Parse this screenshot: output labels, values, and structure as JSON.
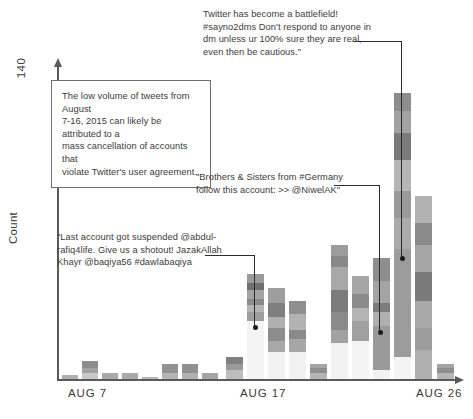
{
  "axes": {
    "y_label": "Count",
    "y_max_label": "140",
    "x_ticks": [
      {
        "label": "AUG 7",
        "x": 68
      },
      {
        "label": "AUG 17",
        "x": 240
      },
      {
        "label": "AUG 26",
        "x": 416
      }
    ]
  },
  "annotations": [
    {
      "id": "anno-top-right",
      "boxed": false,
      "lines": [
        "Twitter has become a battlefield!",
        "#sayno2dms Don't respond to anyone in",
        "dm unless ur 100% sure they are real,",
        "even then be cautious.\""
      ]
    },
    {
      "id": "anno-boxed-left",
      "boxed": true,
      "lines": [
        "The low volume of tweets from August",
        "7-16, 2015 can likely be attributed to a",
        "mass cancellation of accounts that",
        "violate Twitter's user agreement."
      ]
    },
    {
      "id": "anno-germany",
      "boxed": false,
      "lines": [
        "\"Brothers & Sisters from #Germany",
        "follow this account: >> @NiwelAK\""
      ]
    },
    {
      "id": "anno-suspended",
      "boxed": false,
      "lines": [
        "\"Last account got suspended @abdul-",
        "rafiq4life. Give us a shotout! JazakAllah",
        "Khayr @baqiya56 #dawlabaqiya"
      ]
    }
  ],
  "colors": {
    "axis": "#5a5a5a",
    "text": "#3b3b3b",
    "leader": "#2b2b2b",
    "segment_palette": [
      "#f4f4f4",
      "#d6d6d6",
      "#bdbdbd",
      "#a8a8a8",
      "#949494",
      "#7e7e7e",
      "#6a6a6a"
    ]
  },
  "chart_data": {
    "type": "bar",
    "title": "",
    "xlabel": "",
    "ylabel": "Count",
    "ylim": [
      0,
      140
    ],
    "grid": false,
    "legend": "none",
    "stacked": true,
    "categories": [
      "AUG 7",
      "AUG 8",
      "AUG 9",
      "AUG 10",
      "AUG 11",
      "AUG 12",
      "AUG 13",
      "AUG 14",
      "AUG 15",
      "AUG 16",
      "AUG 17",
      "AUG 18",
      "AUG 19",
      "AUG 20",
      "AUG 21",
      "AUG 22",
      "AUG 23",
      "AUG 24",
      "AUG 25",
      "AUG 26"
    ],
    "totals": [
      2,
      8,
      3,
      3,
      1,
      7,
      7,
      3,
      10,
      47,
      41,
      35,
      7,
      60,
      46,
      54,
      128,
      82,
      0,
      7
    ],
    "bars": [
      {
        "category": "AUG 7",
        "total": 2,
        "x": 62,
        "width": 16,
        "segments": [
          {
            "value": 2,
            "color": "#b0b0b0"
          }
        ]
      },
      {
        "category": "AUG 8",
        "total": 8,
        "x": 82,
        "width": 16,
        "segments": [
          {
            "value": 3,
            "color": "#c9c9c9"
          },
          {
            "value": 2,
            "color": "#a0a0a0"
          },
          {
            "value": 3,
            "color": "#8d8d8d"
          }
        ]
      },
      {
        "category": "AUG 9",
        "total": 3,
        "x": 102,
        "width": 16,
        "segments": [
          {
            "value": 3,
            "color": "#a8a8a8"
          }
        ]
      },
      {
        "category": "AUG 10",
        "total": 3,
        "x": 122,
        "width": 16,
        "segments": [
          {
            "value": 3,
            "color": "#a8a8a8"
          }
        ]
      },
      {
        "category": "AUG 11",
        "total": 1,
        "x": 142,
        "width": 16,
        "segments": [
          {
            "value": 1,
            "color": "#b8b8b8"
          }
        ]
      },
      {
        "category": "AUG 12",
        "total": 7,
        "x": 162,
        "width": 16,
        "segments": [
          {
            "value": 3,
            "color": "#b5b5b5"
          },
          {
            "value": 4,
            "color": "#929292"
          }
        ]
      },
      {
        "category": "AUG 13",
        "total": 7,
        "x": 182,
        "width": 16,
        "segments": [
          {
            "value": 3,
            "color": "#b0b0b0"
          },
          {
            "value": 4,
            "color": "#8f8f8f"
          }
        ]
      },
      {
        "category": "AUG 14",
        "total": 3,
        "x": 202,
        "width": 16,
        "segments": [
          {
            "value": 3,
            "color": "#a5a5a5"
          }
        ]
      },
      {
        "category": "AUG 15",
        "total": 0,
        "x": 222,
        "width": 16,
        "segments": []
      },
      {
        "category": "AUG 16",
        "total": 10,
        "x": 226,
        "width": 17,
        "segments": [
          {
            "value": 4,
            "color": "#bdbdbd"
          },
          {
            "value": 3,
            "color": "#9a9a9a"
          },
          {
            "value": 3,
            "color": "#808080"
          }
        ]
      },
      {
        "category": "AUG 17",
        "total": 47,
        "x": 247,
        "width": 17,
        "segments": [
          {
            "value": 26,
            "color": "#f4f4f4"
          },
          {
            "value": 4,
            "color": "#9e9e9e"
          },
          {
            "value": 3,
            "color": "#b5b5b5"
          },
          {
            "value": 3,
            "color": "#8a8a8a"
          },
          {
            "value": 4,
            "color": "#a4a4a4"
          },
          {
            "value": 3,
            "color": "#6f6f6f"
          },
          {
            "value": 4,
            "color": "#9a9a9a"
          }
        ]
      },
      {
        "category": "AUG 18",
        "total": 41,
        "x": 268,
        "width": 17,
        "segments": [
          {
            "value": 12,
            "color": "#f2f2f2"
          },
          {
            "value": 5,
            "color": "#a8a8a8"
          },
          {
            "value": 6,
            "color": "#8c8c8c"
          },
          {
            "value": 5,
            "color": "#b0b0b0"
          },
          {
            "value": 6,
            "color": "#7f7f7f"
          },
          {
            "value": 7,
            "color": "#9e9e9e"
          }
        ]
      },
      {
        "category": "AUG 19",
        "total": 35,
        "x": 289,
        "width": 17,
        "segments": [
          {
            "value": 12,
            "color": "#f2f2f2"
          },
          {
            "value": 6,
            "color": "#a6a6a6"
          },
          {
            "value": 4,
            "color": "#8a8a8a"
          },
          {
            "value": 7,
            "color": "#b2b2b2"
          },
          {
            "value": 6,
            "color": "#8f8f8f"
          }
        ]
      },
      {
        "category": "AUG 20",
        "total": 7,
        "x": 310,
        "width": 17,
        "segments": [
          {
            "value": 3,
            "color": "#b5b5b5"
          },
          {
            "value": 2,
            "color": "#8f8f8f"
          },
          {
            "value": 2,
            "color": "#a5a5a5"
          }
        ]
      },
      {
        "category": "AUG 21",
        "total": 60,
        "x": 331,
        "width": 17,
        "segments": [
          {
            "value": 16,
            "color": "#f2f2f2"
          },
          {
            "value": 6,
            "color": "#a2a2a2"
          },
          {
            "value": 8,
            "color": "#8a8a8a"
          },
          {
            "value": 10,
            "color": "#7c7c7c"
          },
          {
            "value": 10,
            "color": "#a8a8a8"
          },
          {
            "value": 5,
            "color": "#888888"
          },
          {
            "value": 5,
            "color": "#9c9c9c"
          }
        ]
      },
      {
        "category": "AUG 22",
        "total": 46,
        "x": 352,
        "width": 17,
        "segments": [
          {
            "value": 17,
            "color": "#f4f4f4"
          },
          {
            "value": 9,
            "color": "#a0a0a0"
          },
          {
            "value": 6,
            "color": "#b4b4b4"
          },
          {
            "value": 6,
            "color": "#8b8b8b"
          },
          {
            "value": 8,
            "color": "#a6a6a6"
          }
        ]
      },
      {
        "category": "AUG 23",
        "total": 54,
        "x": 373,
        "width": 17,
        "segments": [
          {
            "value": 4,
            "color": "#f2f2f2"
          },
          {
            "value": 20,
            "color": "#9a9a9a"
          },
          {
            "value": 6,
            "color": "#b0b0b0"
          },
          {
            "value": 4,
            "color": "#7d7d7d"
          },
          {
            "value": 10,
            "color": "#a4a4a4"
          },
          {
            "value": 10,
            "color": "#8e8e8e"
          }
        ]
      },
      {
        "category": "AUG 24",
        "total": 128,
        "x": 394,
        "width": 17,
        "segments": [
          {
            "value": 10,
            "color": "#f4f4f4"
          },
          {
            "value": 48,
            "color": "#9c9c9c"
          },
          {
            "value": 14,
            "color": "#ababab"
          },
          {
            "value": 12,
            "color": "#9a9a9a"
          },
          {
            "value": 14,
            "color": "#b6b6b6"
          },
          {
            "value": 12,
            "color": "#7b7b7b"
          },
          {
            "value": 10,
            "color": "#a2a2a2"
          },
          {
            "value": 8,
            "color": "#8d8d8d"
          }
        ]
      },
      {
        "category": "AUG 25",
        "total": 82,
        "x": 415,
        "width": 17,
        "segments": [
          {
            "value": 13,
            "color": "#b0b0b0"
          },
          {
            "value": 10,
            "color": "#9d9d9d"
          },
          {
            "value": 12,
            "color": "#a8a8a8"
          },
          {
            "value": 13,
            "color": "#7a7a7a"
          },
          {
            "value": 12,
            "color": "#a6a6a6"
          },
          {
            "value": 10,
            "color": "#8a8a8a"
          },
          {
            "value": 12,
            "color": "#b2b2b2"
          }
        ]
      },
      {
        "category": "AUG 26",
        "total": 7,
        "x": 437,
        "width": 17,
        "segments": [
          {
            "value": 3,
            "color": "#b5b5b5"
          },
          {
            "value": 2,
            "color": "#8e8e8e"
          },
          {
            "value": 2,
            "color": "#a4a4a4"
          }
        ]
      }
    ]
  }
}
